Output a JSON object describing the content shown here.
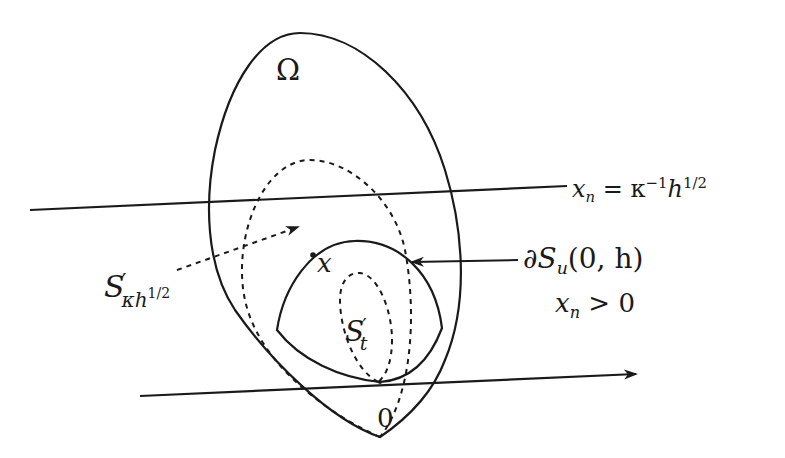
{
  "diagram": {
    "stroke_color": "#1a1a1a",
    "background": "#ffffff",
    "labels": {
      "omega": "Ω",
      "level_line": {
        "var": "x",
        "var_sub": "n",
        "eq": " = κ",
        "kappa_exp": "−1",
        "h": "h",
        "h_exp": "1/2"
      },
      "section_boundary": {
        "partial": "∂",
        "S": "S",
        "S_sub": "u",
        "args": "(0, h)"
      },
      "halfspace": {
        "var": "x",
        "var_sub": "n",
        "rel": " > 0"
      },
      "s_kappa": {
        "S": "S",
        "prime": "′",
        "sub": "κh",
        "sub_exp": "1/2"
      },
      "s_t": {
        "S": "S",
        "prime": "′",
        "sub": "t"
      },
      "point_x": "x",
      "origin": "0"
    }
  }
}
